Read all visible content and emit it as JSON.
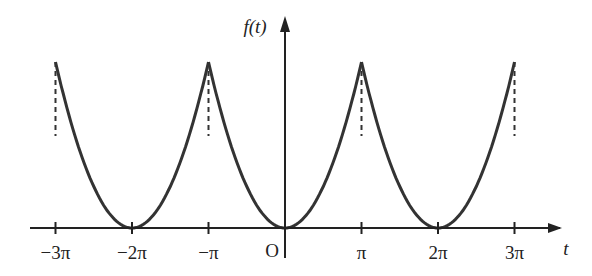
{
  "chart_data": {
    "type": "line",
    "title": "",
    "xlabel": "t",
    "ylabel": "f(t)",
    "origin_label": "O",
    "x_ticks": [
      {
        "value": -3,
        "label": "−3π"
      },
      {
        "value": -2,
        "label": "−2π"
      },
      {
        "value": -1,
        "label": "−π"
      },
      {
        "value": 1,
        "label": "π"
      },
      {
        "value": 2,
        "label": "2π"
      },
      {
        "value": 3,
        "label": "3π"
      }
    ],
    "x_unit": "π",
    "xlim": [
      -3,
      3
    ],
    "period": 2,
    "function": "t^2 on (-π, π)",
    "series": [
      {
        "name": "f(t)",
        "segments": [
          {
            "x_start": -3,
            "x_end": -1,
            "center": -2,
            "y_start": 0.5,
            "y_end": 1
          },
          {
            "x_start": -1,
            "x_end": 1,
            "center": 0,
            "y_start": 0.5,
            "y_end": 1
          },
          {
            "x_start": 1,
            "x_end": 3,
            "center": 2,
            "y_start": 0.5,
            "y_end": 1
          }
        ]
      }
    ],
    "dashed_lines_at": [
      -3,
      -1,
      1,
      3
    ],
    "grid": false,
    "legend": null
  },
  "labels": {
    "y_axis": "f(t)",
    "x_axis": "t",
    "origin": "O",
    "ticks": [
      "−3π",
      "−2π",
      "−π",
      "π",
      "2π",
      "3π"
    ]
  }
}
